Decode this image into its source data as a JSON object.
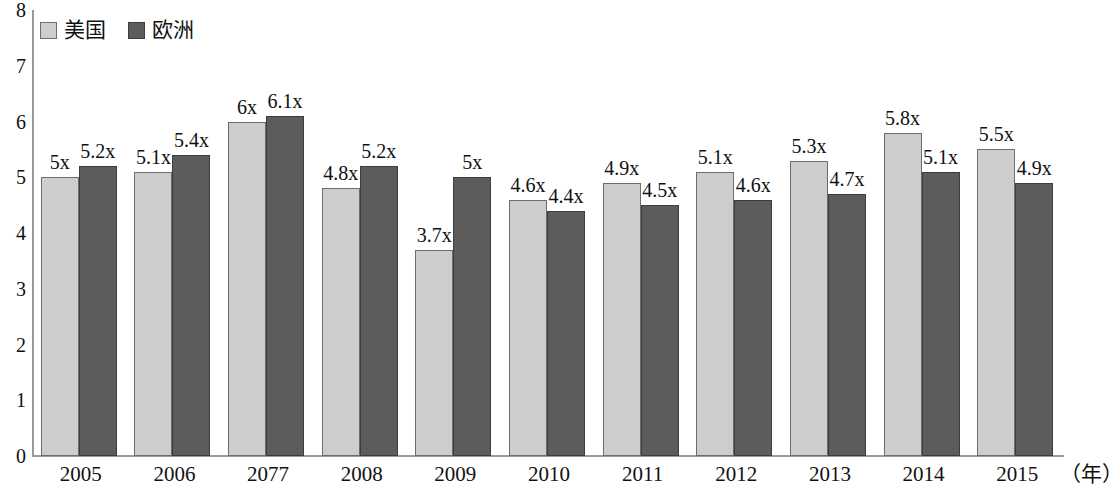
{
  "legend": {
    "position": "top-left",
    "entries": [
      {
        "label": "美国",
        "color": "#cdcdcd",
        "swatch": "us"
      },
      {
        "label": "欧洲",
        "color": "#5c5c5c",
        "swatch": "eu"
      }
    ]
  },
  "axes": {
    "x_unit_label": "（年）",
    "y_ticks": [
      "8",
      "7",
      "6",
      "5",
      "4",
      "3",
      "2",
      "1",
      "0"
    ]
  },
  "chart_data": {
    "type": "bar",
    "title": "",
    "subtitle": "",
    "xlabel": "（年）",
    "ylabel": "",
    "ylim": [
      0,
      8
    ],
    "ytick_step": 1,
    "grid": false,
    "legend_position": "top-left",
    "categories": [
      "2005",
      "2006",
      "2077",
      "2008",
      "2009",
      "2010",
      "2011",
      "2012",
      "2013",
      "2014",
      "2015"
    ],
    "series": [
      {
        "name": "美国",
        "color": "#cdcdcd",
        "values": [
          5,
          5.1,
          6,
          4.8,
          3.7,
          4.6,
          4.9,
          5.1,
          5.3,
          5.8,
          5.5
        ],
        "labels": [
          "5x",
          "5.1x",
          "6x",
          "4.8x",
          "3.7x",
          "4.6x",
          "4.9x",
          "5.1x",
          "5.3x",
          "5.8x",
          "5.5x"
        ]
      },
      {
        "name": "欧洲",
        "color": "#5c5c5c",
        "values": [
          5.2,
          5.4,
          6.1,
          5.2,
          5,
          4.4,
          4.5,
          4.6,
          4.7,
          5.1,
          4.9
        ],
        "labels": [
          "5.2x",
          "5.4x",
          "6.1x",
          "5.2x",
          "5x",
          "4.4x",
          "4.5x",
          "4.6x",
          "4.7x",
          "5.1x",
          "4.9x"
        ]
      }
    ]
  }
}
